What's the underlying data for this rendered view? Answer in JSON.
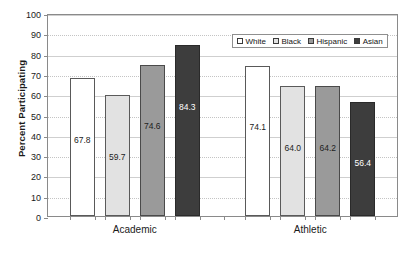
{
  "chart_data": {
    "type": "bar",
    "title": "",
    "xlabel": "",
    "ylabel": "Percent Participating",
    "ylim": [
      0,
      100
    ],
    "ytick_step": 10,
    "yticks": [
      "100",
      "90",
      "80",
      "70",
      "60",
      "50",
      "40",
      "30",
      "20",
      "10",
      "0"
    ],
    "categories": [
      "Academic",
      "Athletic"
    ],
    "grid": true,
    "legend_position": "top-right",
    "series": [
      {
        "name": "White",
        "values": [
          67.8,
          74.1
        ],
        "labels": [
          "67.8",
          "74.1"
        ],
        "color": "#ffffff"
      },
      {
        "name": "Black",
        "values": [
          59.7,
          64.0
        ],
        "labels": [
          "59.7",
          "64.0"
        ],
        "color": "#e2e2e2"
      },
      {
        "name": "Hispanic",
        "values": [
          74.6,
          64.2
        ],
        "labels": [
          "74.6",
          "64.2"
        ],
        "color": "#9a9a9a"
      },
      {
        "name": "Asian",
        "values": [
          84.3,
          56.4
        ],
        "labels": [
          "84.3",
          "56.4"
        ],
        "color": "#3d3d3d"
      }
    ]
  },
  "legend": {
    "items": [
      {
        "label": "White"
      },
      {
        "label": "Black"
      },
      {
        "label": "Hispanic"
      },
      {
        "label": "Asian"
      }
    ]
  },
  "axis": {
    "y_title": "Percent Participating"
  }
}
